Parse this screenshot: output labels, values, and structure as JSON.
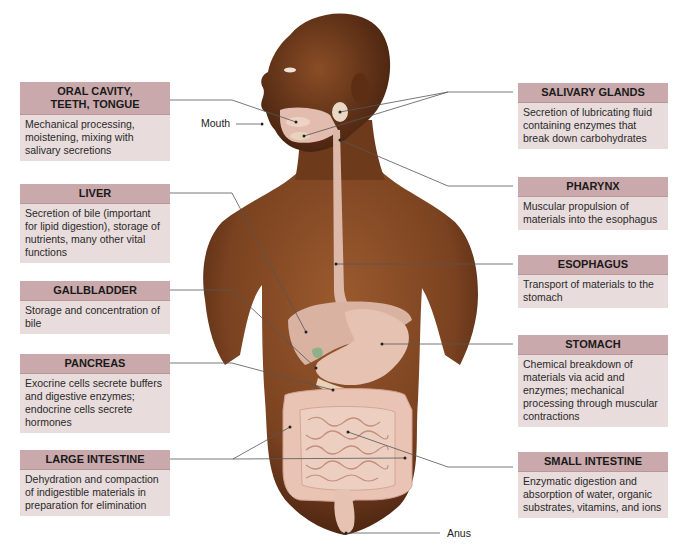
{
  "diagram": {
    "point_labels": {
      "mouth": "Mouth",
      "anus": "Anus"
    },
    "left_boxes": [
      {
        "id": "oral",
        "title": "ORAL CAVITY, TEETH, TONGUE",
        "title_line1": "ORAL CAVITY,",
        "title_line2": "TEETH, TONGUE",
        "text": "Mechanical processing, moistening, mixing with salivary secretions"
      },
      {
        "id": "liver",
        "title": "LIVER",
        "text": "Secretion of bile (important for lipid digestion), storage of nutrients, many other vital functions"
      },
      {
        "id": "gallbladder",
        "title": "GALLBLADDER",
        "text": "Storage and concentration of bile"
      },
      {
        "id": "pancreas",
        "title": "PANCREAS",
        "text": "Exocrine cells secrete buffers and digestive enzymes; endocrine cells secrete hormones"
      },
      {
        "id": "large_intestine",
        "title": "LARGE INTESTINE",
        "text": "Dehydration and compaction of indigestible materials in preparation for elimination"
      }
    ],
    "right_boxes": [
      {
        "id": "salivary",
        "title": "SALIVARY GLANDS",
        "text": "Secretion of lubricating fluid containing enzymes that break down carbohydrates"
      },
      {
        "id": "pharynx",
        "title": "PHARYNX",
        "text": "Muscular propulsion of materials into the esophagus"
      },
      {
        "id": "esophagus",
        "title": "ESOPHAGUS",
        "text": "Transport of materials to the stomach"
      },
      {
        "id": "stomach",
        "title": "STOMACH",
        "text": "Chemical breakdown of materials via acid and enzymes; mechanical processing through muscular contractions"
      },
      {
        "id": "small_intestine",
        "title": "SMALL INTESTINE",
        "text": "Enzymatic digestion and absorption of water, organic substrates, vitamins, and ions"
      }
    ],
    "colors": {
      "box_header": "#c9a9ab",
      "box_body": "#e8dcdc",
      "skin": "#7a4220",
      "organ": "#e9c3b3",
      "leader_line": "#555555"
    }
  }
}
